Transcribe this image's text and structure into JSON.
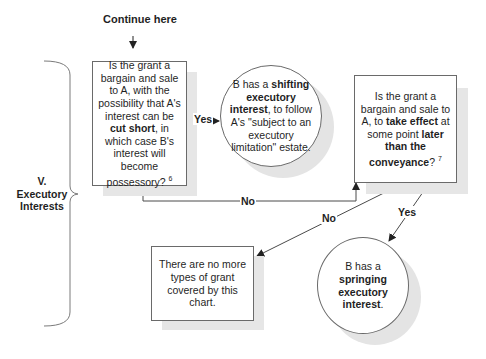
{
  "header": {
    "continue_label": "Continue here"
  },
  "section": {
    "number": "V.",
    "title_line1": "Executory",
    "title_line2": "Interests"
  },
  "nodes": {
    "q1": {
      "pre": "Is the grant a bargain and sale to A, with the possibility that A's interest can be ",
      "bold1": "cut short",
      "post": ", in which case B's interest will become possessory? ",
      "footnote": "6"
    },
    "r1": {
      "pre": "B has a ",
      "bold1": "shifting executory interest",
      "post": ", to follow A's \"subject to an executory limitation\" estate."
    },
    "q2": {
      "pre": "Is the grant a bargain and sale to A, to ",
      "bold1": "take effect",
      "mid": " at some point ",
      "bold2": "later than the conveyance",
      "post": "? ",
      "footnote": "7"
    },
    "r2": {
      "text": "There are no more types of grant covered by this chart."
    },
    "r3": {
      "pre": "B has a ",
      "bold1": "springing executory interest",
      "post": "."
    }
  },
  "edges": {
    "q1_yes": "Yes",
    "q1_no": "No",
    "q2_no": "No",
    "q2_yes": "Yes"
  },
  "colors": {
    "line": "#4a4a4a",
    "border": "#6a6a6a",
    "shadow": "#e6e6e6",
    "text": "#1f1f1f"
  }
}
